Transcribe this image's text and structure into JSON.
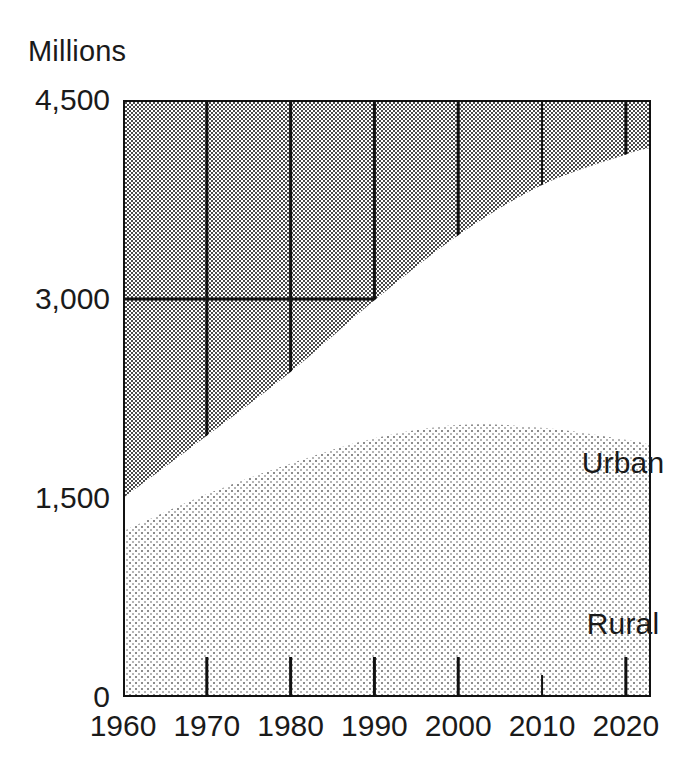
{
  "chart_data": {
    "type": "area",
    "title": "",
    "subtitle": "",
    "xlabel": "",
    "ylabel": "Millions",
    "unit_label": "Millions",
    "stacked": true,
    "grid": true,
    "legend_position": "inline",
    "xlim": [
      1960,
      2023
    ],
    "ylim": [
      0,
      4500
    ],
    "x_tick_labels": [
      "1960",
      "1970",
      "1980",
      "1990",
      "2000",
      "2010",
      "2020"
    ],
    "x_tick_values": [
      1960,
      1970,
      1980,
      1990,
      2000,
      2010,
      2020
    ],
    "y_tick_labels": [
      "0",
      "1,500",
      "3,000",
      "4,500"
    ],
    "y_tick_values": [
      0,
      1500,
      3000,
      4500
    ],
    "x": [
      1960,
      1970,
      1980,
      1990,
      2000,
      2010,
      2020,
      2023
    ],
    "series": [
      {
        "name": "Rural",
        "label": "Rural",
        "values": [
          1250,
          1530,
          1760,
          1950,
          2050,
          2030,
          1940,
          1900
        ],
        "fill": "light-dither"
      },
      {
        "name": "Urban",
        "label": "Urban",
        "values": [
          250,
          440,
          690,
          1040,
          1430,
          1830,
          2150,
          2240
        ],
        "fill": "white"
      }
    ],
    "cumulative_total": [
      1500,
      1970,
      2450,
      2990,
      3480,
      3860,
      4090,
      4140
    ],
    "annotations": [
      {
        "text": "Urban",
        "x": 2008,
        "y": 2950
      },
      {
        "text": "Rural",
        "x": 2008,
        "y": 1100
      }
    ],
    "colors": {
      "background_fill": "#9a9a9a",
      "rural_fill": "#d8d8d8",
      "urban_fill": "#ffffff",
      "axis": "#111111",
      "grid": "#111111",
      "text": "#1a1a1a"
    }
  },
  "axis": {
    "unit": "Millions",
    "y_ticks": [
      {
        "label": "4,500",
        "value": 4500
      },
      {
        "label": "3,000",
        "value": 3000
      },
      {
        "label": "1,500",
        "value": 1500
      },
      {
        "label": "0",
        "value": 0
      }
    ],
    "x_ticks": [
      {
        "label": "1960",
        "value": 1960
      },
      {
        "label": "1970",
        "value": 1970
      },
      {
        "label": "1980",
        "value": 1980
      },
      {
        "label": "1990",
        "value": 1990
      },
      {
        "label": "2000",
        "value": 2000
      },
      {
        "label": "2010",
        "value": 2010
      },
      {
        "label": "2020",
        "value": 2020
      }
    ]
  },
  "labels": {
    "urban": "Urban",
    "rural": "Rural"
  }
}
